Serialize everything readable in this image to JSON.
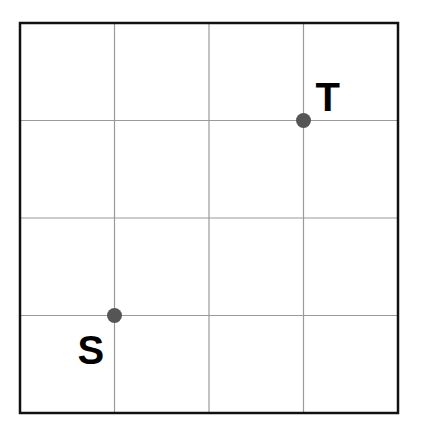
{
  "diagram": {
    "type": "grid",
    "rows": 4,
    "cols": 4,
    "frame": {
      "x": 20,
      "y": 23,
      "width": 378,
      "height": 390
    },
    "colors": {
      "border": "#111111",
      "grid_line": "#9a9a9a",
      "point": "#555555",
      "label": "#000000"
    },
    "points": [
      {
        "id": "S",
        "label": "S",
        "grid_col": 1,
        "grid_row": 3,
        "label_position": "below-left"
      },
      {
        "id": "T",
        "label": "T",
        "grid_col": 3,
        "grid_row": 1,
        "label_position": "above-right"
      }
    ]
  }
}
